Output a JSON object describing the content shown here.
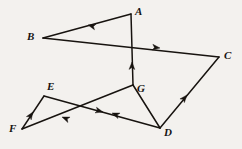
{
  "figure": {
    "background_color": "#f3f1ee",
    "stroke_color": "#17130f",
    "label_color": "#161412",
    "canvas": {
      "width": 242,
      "height": 149
    },
    "points": [
      {
        "id": "A",
        "label": "A",
        "x": 131,
        "y": 14,
        "label_x": 135,
        "label_y": 6
      },
      {
        "id": "B",
        "label": "B",
        "x": 43,
        "y": 38,
        "label_x": 27,
        "label_y": 31
      },
      {
        "id": "C",
        "label": "C",
        "x": 219,
        "y": 57,
        "label_x": 224,
        "label_y": 50
      },
      {
        "id": "D",
        "label": "D",
        "x": 160,
        "y": 128,
        "label_x": 164,
        "label_y": 127
      },
      {
        "id": "E",
        "label": "E",
        "x": 44,
        "y": 96,
        "label_x": 47,
        "label_y": 81
      },
      {
        "id": "F",
        "label": "F",
        "x": 22,
        "y": 129,
        "label_x": 9,
        "label_y": 123
      },
      {
        "id": "G",
        "label": "G",
        "x": 133,
        "y": 85,
        "label_x": 137,
        "label_y": 83
      }
    ],
    "segments": [
      {
        "id": "A-B",
        "from": "A",
        "to": "B",
        "x1": 131,
        "y1": 14,
        "x2": 43,
        "y2": 38,
        "arrow_t": 0.52,
        "arrow_dir": "to-B"
      },
      {
        "id": "B-C",
        "from": "B",
        "to": "C",
        "x1": 43,
        "y1": 38,
        "x2": 219,
        "y2": 57,
        "arrow_t": 0.66,
        "arrow_dir": "to-C"
      },
      {
        "id": "G-A",
        "from": "G",
        "to": "A",
        "x1": 133,
        "y1": 85,
        "x2": 131,
        "y2": 14,
        "arrow_t": 0.5,
        "arrow_dir": "to-A"
      },
      {
        "id": "D-C",
        "from": "D",
        "to": "C",
        "x1": 160,
        "y1": 128,
        "x2": 219,
        "y2": 57,
        "arrow_t": 0.46,
        "arrow_dir": "to-C"
      },
      {
        "id": "D-G",
        "from": "D",
        "to": "G",
        "x1": 160,
        "y1": 128,
        "x2": 133,
        "y2": 85,
        "arrow_t": 0.0,
        "arrow_dir": "none"
      },
      {
        "id": "G-F",
        "from": "G",
        "to": "F",
        "x1": 133,
        "y1": 85,
        "x2": 22,
        "y2": 129,
        "arrow_t": 0.62,
        "arrow_dir": "to-F"
      },
      {
        "id": "F-E",
        "from": "F",
        "to": "E",
        "x1": 22,
        "y1": 129,
        "x2": 44,
        "y2": 96,
        "arrow_t": 0.52,
        "arrow_dir": "to-E"
      },
      {
        "id": "E-D",
        "from": "E",
        "to": "D",
        "x1": 44,
        "y1": 96,
        "x2": 160,
        "y2": 128,
        "arrow_t": 0.52,
        "arrow_dir": "to-D"
      }
    ],
    "arrowheads": [
      {
        "id": "arrow-ab",
        "on": "A-B",
        "x": 88,
        "y": 25,
        "angle": 195
      },
      {
        "id": "arrow-bc",
        "on": "B-C",
        "x": 160,
        "y": 48,
        "angle": 6
      },
      {
        "id": "arrow-ga",
        "on": "G-A",
        "x": 132,
        "y": 62,
        "angle": 271
      },
      {
        "id": "arrow-dc",
        "on": "D-C",
        "x": 187,
        "y": 95,
        "angle": 310
      },
      {
        "id": "arrow-gf",
        "on": "G-F",
        "x": 112,
        "y": 113,
        "angle": 202
      },
      {
        "id": "arrow-gf2",
        "on": "G-F",
        "x": 62,
        "y": 117,
        "angle": 202
      },
      {
        "id": "arrow-fe",
        "on": "F-E",
        "x": 33,
        "y": 112,
        "angle": 304
      },
      {
        "id": "arrow-ed",
        "on": "E-D",
        "x": 103,
        "y": 112,
        "angle": 15
      }
    ],
    "crossing_point": {
      "id": "X",
      "x": 82,
      "y": 113
    }
  }
}
